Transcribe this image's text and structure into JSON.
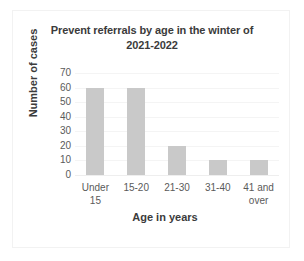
{
  "chart_data": {
    "type": "bar",
    "title": "Prevent referrals by age in the winter of 2021-2022",
    "title_line1": "Prevent referrals by age in the winter of",
    "title_line2": "2021-2022",
    "xlabel": "Age in years",
    "ylabel": "Number of cases",
    "categories": [
      "Under 15",
      "15-20",
      "21-30",
      "31-40",
      "41 and over"
    ],
    "category_lines": [
      [
        "Under",
        "15"
      ],
      [
        "15-20"
      ],
      [
        "21-30"
      ],
      [
        "31-40"
      ],
      [
        "41 and",
        "over"
      ]
    ],
    "values": [
      60,
      60,
      20,
      10,
      10
    ],
    "ylim": [
      0,
      70
    ],
    "ytick_step": 10,
    "yticks": [
      70,
      60,
      50,
      40,
      30,
      20,
      10,
      0
    ],
    "grid": true,
    "legend": false,
    "bar_color": "#c9c9c9",
    "text_color": "#3b3b3b",
    "tick_color": "#5a5a5a",
    "gridline_color": "#f4f4f4",
    "background": "#ffffff",
    "border_color": "#f2f2f2"
  }
}
